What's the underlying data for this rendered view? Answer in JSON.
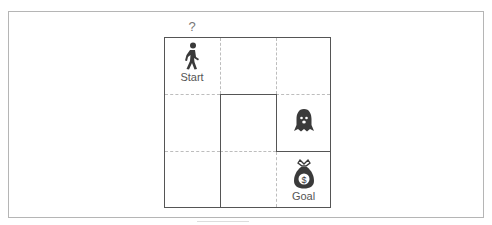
{
  "diagram": {
    "title_mark": "?",
    "grid": {
      "rows": 3,
      "cols": 3
    },
    "cells": {
      "start": {
        "row": 0,
        "col": 0,
        "icon": "person-walking-icon",
        "label": "Start"
      },
      "ghost": {
        "row": 1,
        "col": 2,
        "icon": "ghost-icon",
        "label": ""
      },
      "goal": {
        "row": 2,
        "col": 2,
        "icon": "money-bag-icon",
        "label": "Goal"
      }
    },
    "walls": [
      "top of cell (1,1)",
      "left of cells (1,1) and (2,1)",
      "right of cell (1,1)",
      "bottom of cell (1,2)"
    ],
    "colors": {
      "wall": "#555555",
      "dashed": "#bdbdbd",
      "icon": "#3a3a3a",
      "text": "#555555"
    }
  }
}
